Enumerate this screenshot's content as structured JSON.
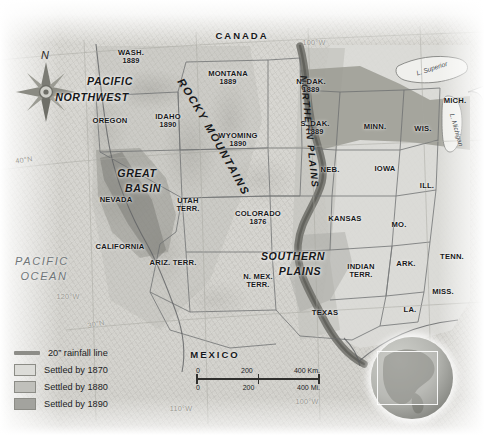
{
  "map": {
    "title": "Western United States settlement and 20 inch rainfall line",
    "countries": [
      {
        "name": "CANADA",
        "x": 242,
        "y": 36
      },
      {
        "name": "MEXICO",
        "x": 215,
        "y": 355
      }
    ],
    "oceans": [
      {
        "name": "PACIFIC",
        "x": 42,
        "y": 262
      },
      {
        "name": "OCEAN",
        "x": 44,
        "y": 277
      }
    ],
    "lakes": [
      {
        "name": "L. Superior",
        "x": 432,
        "y": 69,
        "rot": -18
      },
      {
        "name": "L. Michigan",
        "x": 456,
        "y": 130,
        "rot": 74
      }
    ],
    "regions": [
      {
        "name": "PACIFIC",
        "x": 110,
        "y": 81
      },
      {
        "name": "NORTHWEST",
        "x": 92,
        "y": 97
      },
      {
        "name": "GREAT",
        "x": 137,
        "y": 173
      },
      {
        "name": "BASIN",
        "x": 143,
        "y": 188
      },
      {
        "name": "SOUTHERN",
        "x": 293,
        "y": 256
      },
      {
        "name": "PLAINS",
        "x": 300,
        "y": 271
      }
    ],
    "curved_regions": [
      {
        "name": "ROCKY MOUNTAINS",
        "path": "rocky"
      },
      {
        "name": "NORTHERN PLAINS",
        "path": "northern"
      }
    ],
    "states": [
      {
        "name": "WASH.",
        "year": "1889",
        "x": 131,
        "y": 57
      },
      {
        "name": "OREGON",
        "year": "",
        "x": 110,
        "y": 121
      },
      {
        "name": "IDAHO",
        "year": "1890",
        "x": 168,
        "y": 121
      },
      {
        "name": "MONTANA",
        "year": "1889",
        "x": 228,
        "y": 78
      },
      {
        "name": "WYOMING",
        "year": "1890",
        "x": 238,
        "y": 140
      },
      {
        "name": "N. DAK.",
        "year": "1889",
        "x": 311,
        "y": 86
      },
      {
        "name": "S. DAK.",
        "year": "1889",
        "x": 315,
        "y": 128
      },
      {
        "name": "MINN.",
        "year": "",
        "x": 375,
        "y": 127
      },
      {
        "name": "WIS.",
        "year": "",
        "x": 423,
        "y": 129
      },
      {
        "name": "MICH.",
        "year": "",
        "x": 455,
        "y": 101
      },
      {
        "name": "NEB.",
        "year": "",
        "x": 330,
        "y": 170
      },
      {
        "name": "IOWA",
        "year": "",
        "x": 385,
        "y": 169
      },
      {
        "name": "ILL.",
        "year": "",
        "x": 427,
        "y": 186
      },
      {
        "name": "NEVADA",
        "year": "",
        "x": 116,
        "y": 200
      },
      {
        "name": "UTAH",
        "year": "TERR.",
        "x": 188,
        "y": 205
      },
      {
        "name": "COLORADO",
        "year": "1876",
        "x": 258,
        "y": 218
      },
      {
        "name": "KANSAS",
        "year": "",
        "x": 345,
        "y": 219
      },
      {
        "name": "MO.",
        "year": "",
        "x": 399,
        "y": 225
      },
      {
        "name": "CALIFORNIA",
        "year": "",
        "x": 120,
        "y": 247
      },
      {
        "name": "ARIZ. TERR.",
        "year": "",
        "x": 173,
        "y": 263
      },
      {
        "name": "N. MEX.",
        "year": "TERR.",
        "x": 258,
        "y": 281
      },
      {
        "name": "INDIAN",
        "year": "TERR.",
        "x": 361,
        "y": 271
      },
      {
        "name": "ARK.",
        "year": "",
        "x": 406,
        "y": 264
      },
      {
        "name": "TENN.",
        "year": "",
        "x": 452,
        "y": 257
      },
      {
        "name": "MISS.",
        "year": "",
        "x": 443,
        "y": 292
      },
      {
        "name": "LA.",
        "year": "",
        "x": 410,
        "y": 310
      },
      {
        "name": "TEXAS",
        "year": "",
        "x": 325,
        "y": 313
      }
    ],
    "graticule": [
      {
        "label": "40°N",
        "x": 24,
        "y": 160,
        "rot": -8
      },
      {
        "label": "30°N",
        "x": 96,
        "y": 324,
        "rot": -11
      },
      {
        "label": "120°W",
        "x": 68,
        "y": 297,
        "rot": 0
      },
      {
        "label": "110°W",
        "x": 181,
        "y": 409,
        "rot": 0
      },
      {
        "label": "100°W",
        "x": 307,
        "y": 402,
        "rot": 0
      },
      {
        "label": "100°W",
        "x": 314,
        "y": 43,
        "rot": 0
      }
    ]
  },
  "compass": {
    "label": "N",
    "x": 46,
    "y": 92
  },
  "legend": {
    "rainfall": {
      "label": "20” rainfall line",
      "color": "#8d8d88"
    },
    "items": [
      {
        "label": "Settled by 1870",
        "color": "#dcdcd8"
      },
      {
        "label": "Settled by 1880",
        "color": "#c0c0bb"
      },
      {
        "label": "Settled by 1890",
        "color": "#a3a39e"
      }
    ]
  },
  "scale": {
    "km": {
      "ticks": [
        "0",
        "200",
        "400 Km."
      ]
    },
    "mi": {
      "ticks": [
        "0",
        "200",
        "400 Mi."
      ]
    }
  },
  "colors": {
    "settled_1870": "#dcdcd8",
    "settled_1880": "#c0c0bb",
    "settled_1890": "#a3a39e",
    "rainfall_line": "#6b6b66",
    "land": "#d5d4cf",
    "text": "#17181a"
  }
}
